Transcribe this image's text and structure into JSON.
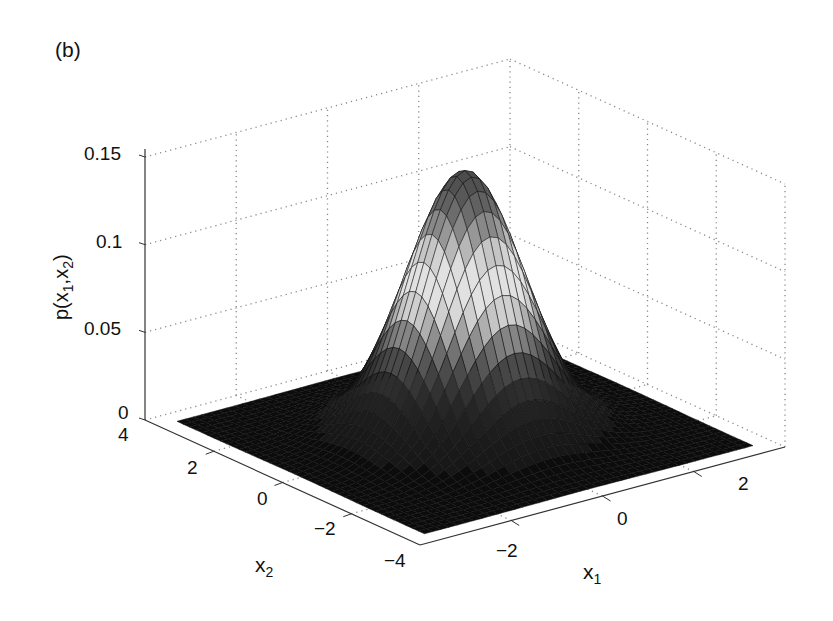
{
  "panel_label": "(b)",
  "chart_data": {
    "type": "surface3d",
    "title": "",
    "panel": "(b)",
    "xlabel": "x_1",
    "ylabel": "x_2",
    "zlabel": "p(x_1,x_2)",
    "xlim": [
      -4,
      4
    ],
    "ylim": [
      -4,
      4
    ],
    "zlim": [
      0,
      0.15
    ],
    "x_ticks": [
      -2,
      0,
      2
    ],
    "y_ticks": [
      -4,
      -2,
      0,
      2,
      4
    ],
    "z_ticks": [
      0,
      0.05,
      0.1,
      0.15
    ],
    "grid": true,
    "colormap": "gray",
    "shading": "faceted",
    "peak": {
      "x1": 0,
      "x2": 0,
      "z": 0.15
    }
  },
  "labels": {
    "z_tick_0": "0",
    "z_tick_005": "0.05",
    "z_tick_01": "0.1",
    "z_tick_015": "0.15",
    "y_tick_4": "4",
    "y_tick_2": "2",
    "y_tick_0": "0",
    "y_tick_m2": "−2",
    "y_tick_m4": "−4",
    "x_tick_m2": "−2",
    "x_tick_0": "0",
    "x_tick_2": "2",
    "zlabel_main": "p(x",
    "zlabel_sub1": "1",
    "zlabel_mid": ",x",
    "zlabel_sub2": "2",
    "zlabel_end": ")",
    "xlabel_main": "x",
    "xlabel_sub": "1",
    "ylabel_main": "x",
    "ylabel_sub": "2"
  }
}
